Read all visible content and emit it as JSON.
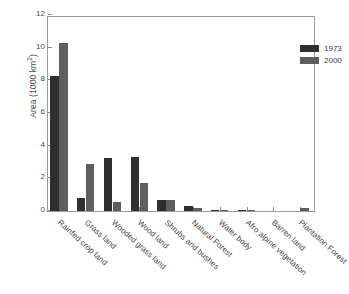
{
  "chart_data": {
    "type": "bar",
    "title": "",
    "xlabel": "",
    "ylabel": "Area (1000 km",
    "ylabel_sup": "2",
    "ylabel_tail": ")",
    "ylim": [
      0,
      12
    ],
    "yticks": [
      0,
      2,
      4,
      6,
      8,
      10,
      12
    ],
    "ytick_labels": [
      "0",
      "2",
      "4",
      "6",
      "8",
      "10",
      "12"
    ],
    "grid": false,
    "legend_position": "top-right",
    "categories": [
      "Rainfed crop land",
      "Grass land",
      "Wooded grass land",
      "Wood land",
      "Shrubs and bushes",
      "Natural Forest",
      "Water body",
      "Afro alpine vegetation",
      "Barren land",
      "Plantation Forest"
    ],
    "series": [
      {
        "name": "1973",
        "color": "#2f2f2f",
        "values": [
          8.25,
          0.8,
          3.25,
          3.3,
          0.7,
          0.3,
          0.02,
          0.05,
          0.0,
          0.0
        ]
      },
      {
        "name": "2000",
        "color": "#5e5e5e",
        "values": [
          10.3,
          2.9,
          0.55,
          1.7,
          0.65,
          0.2,
          0.02,
          0.02,
          0.0,
          0.2
        ]
      }
    ]
  },
  "colors": {
    "series_1973": "#2f2f2f",
    "series_2000": "#5e5e5e",
    "axis": "#9a9a9a",
    "text": "#3a3a3a",
    "background": "#ffffff"
  }
}
